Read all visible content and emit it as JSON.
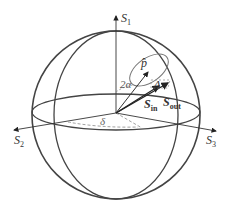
{
  "diagram": {
    "colors": {
      "stroke": "#444444",
      "light": "#888888",
      "background": "#ffffff"
    },
    "axes": {
      "s1": {
        "main": "S",
        "sub": "1"
      },
      "s2": {
        "main": "S",
        "sub": "2"
      },
      "s3": {
        "main": "S",
        "sub": "3"
      }
    },
    "labels": {
      "p_hat": "p̂",
      "two_alpha": "2α",
      "delta_cap": "Δ",
      "delta_small": "δ",
      "s_in": {
        "main": "S",
        "sub": "in"
      },
      "s_out": {
        "main": "S",
        "sub": "out"
      }
    }
  }
}
